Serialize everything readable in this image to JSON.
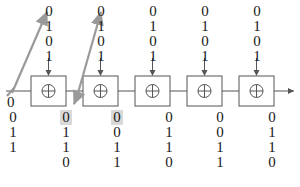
{
  "diagram": {
    "colors": {
      "wire": "#555555",
      "gate_stroke": "#555555",
      "arrow_gray": "#9a9a9a",
      "text": "#1a1a1a",
      "highlight": "#d9d9d9"
    },
    "gates": [
      {
        "name": "xor-gate-1",
        "symbol": "⊕"
      },
      {
        "name": "xor-gate-2",
        "symbol": "⊕"
      },
      {
        "name": "xor-gate-3",
        "symbol": "⊕"
      },
      {
        "name": "xor-gate-4",
        "symbol": "⊕"
      },
      {
        "name": "xor-gate-5",
        "symbol": "⊕"
      }
    ],
    "top_columns": [
      {
        "name": "key-column-1",
        "bits": [
          "0",
          "1",
          "0",
          "1"
        ],
        "highlight_index": -1
      },
      {
        "name": "key-column-2",
        "bits": [
          "0",
          "1",
          "0",
          "1"
        ],
        "highlight_index": -1
      },
      {
        "name": "key-column-3",
        "bits": [
          "0",
          "1",
          "0",
          "1"
        ],
        "highlight_index": -1
      },
      {
        "name": "key-column-4",
        "bits": [
          "0",
          "1",
          "0",
          "1"
        ],
        "highlight_index": -1
      },
      {
        "name": "key-column-5",
        "bits": [
          "0",
          "1",
          "0",
          "1"
        ],
        "highlight_index": -1
      }
    ],
    "bottom_columns": [
      {
        "name": "data-column-1",
        "bits": [
          "0",
          "1",
          "1"
        ],
        "highlight_index": -1
      },
      {
        "name": "data-column-2",
        "bits": [
          "0",
          "1",
          "1",
          "0"
        ],
        "highlight_index": 0
      },
      {
        "name": "data-column-3",
        "bits": [
          "0",
          "0",
          "1",
          "1"
        ],
        "highlight_index": 0
      },
      {
        "name": "data-column-4",
        "bits": [
          "0",
          "1",
          "1",
          "0"
        ],
        "highlight_index": -1
      },
      {
        "name": "data-column-5",
        "bits": [
          "0",
          "0",
          "1",
          "1"
        ],
        "highlight_index": -1
      },
      {
        "name": "data-column-6",
        "bits": [
          "0",
          "1",
          "1",
          "0"
        ],
        "highlight_index": -1
      }
    ],
    "wire_input_label": "0",
    "icons": {
      "xor": "⊕",
      "arrow_right": "arrow-right-icon",
      "arrow_down": "arrow-down-icon",
      "arrow_diagonal": "arrow-diagonal-icon"
    }
  }
}
